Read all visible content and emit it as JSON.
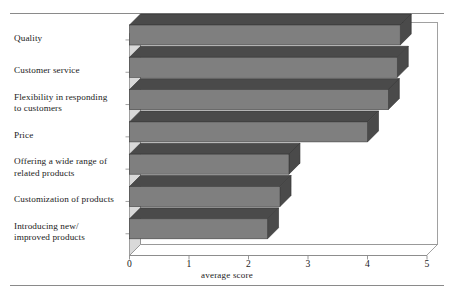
{
  "chart_data": {
    "type": "bar",
    "orientation": "horizontal",
    "style": "3d",
    "title": "",
    "xlabel": "average score",
    "ylabel": "",
    "xlim": [
      0,
      5
    ],
    "xticks": [
      "0",
      "1",
      "2",
      "3",
      "4",
      "5"
    ],
    "grid": false,
    "legend": null,
    "categories": [
      "Quality",
      "Customer service",
      "Flexibility in responding to customers",
      "Price",
      "Offering a wide range of related products",
      "Customization of products",
      "Introducing new/ improved products"
    ],
    "category_lines": [
      [
        "Quality"
      ],
      [
        "Customer service"
      ],
      [
        "Flexibility in responding",
        "to customers"
      ],
      [
        "Price"
      ],
      [
        "Offering a wide range of",
        "related products"
      ],
      [
        "Customization of products"
      ],
      [
        "Introducing new/",
        "improved products"
      ]
    ],
    "values": [
      4.55,
      4.5,
      4.35,
      4.0,
      2.68,
      2.53,
      2.32
    ],
    "bar_face_color": "#7f7f7f",
    "bar_top_color": "#4a4a4a",
    "bar_side_color": "#4a4a4a",
    "wall_color": "#d9d9d9",
    "axis_color": "#8a8a8a",
    "text_color": "#1b1b1b"
  }
}
